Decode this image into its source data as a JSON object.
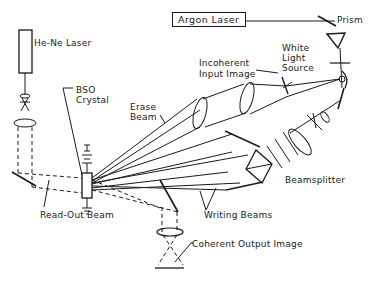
{
  "diagram": {
    "labels": {
      "argon_laser": "Argon Laser",
      "prism": "Prism",
      "he_ne_laser": "He-Ne Laser",
      "white_light_source": "White Light Source",
      "white_light_line1": "White",
      "white_light_line2": "Light",
      "white_light_line3": "Source",
      "incoherent_input_line1": "Incoherent",
      "incoherent_input_line2": "Input Image",
      "bso_line1": "BSO",
      "bso_line2": "Crystal",
      "erase_line1": "Erase",
      "erase_line2": "Beam",
      "beamsplitter": "Beamsplitter",
      "read_out_beam": "Read-Out Beam",
      "writing_beams": "Writing Beams",
      "coherent_output_image": "Coherent Output Image"
    },
    "line_color": "#1a1a1a",
    "background": "#ffffff"
  }
}
